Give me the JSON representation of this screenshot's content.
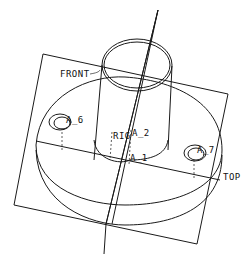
{
  "drawing": {
    "title": "Flange part with datum planes and axes",
    "labels": {
      "front_plane": "FRONT",
      "right_plane": "RIG",
      "top_plane": "TOP",
      "axis_1": "A_1",
      "axis_2": "A_2",
      "axis_6": "A_6",
      "axis_7": "A_7"
    },
    "colors": {
      "line": "#1a1a1a",
      "background": "#ffffff"
    }
  }
}
